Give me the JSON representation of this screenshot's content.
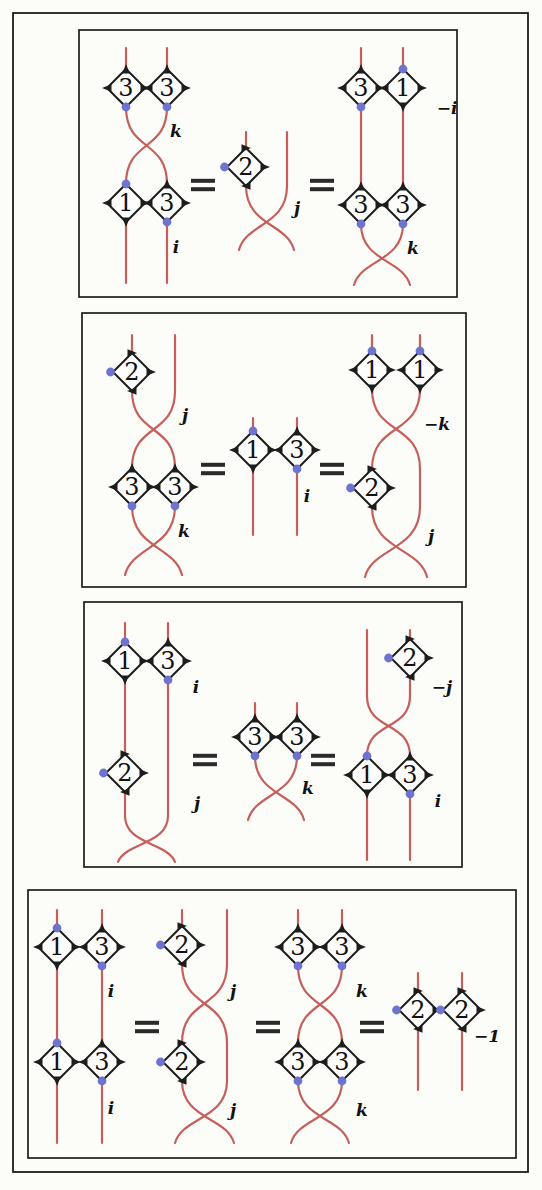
{
  "figure": {
    "canvas": {
      "width": 542,
      "height": 1190
    }
  },
  "colors": {
    "strand": "#c55f5b",
    "dot": "#6e74cd",
    "outline": "#1d1d1d",
    "number": "#111111",
    "label": "#111111",
    "equals": "#2a2a2a",
    "background": "#fcfcf9",
    "diamond_fill": "#fdfdfb",
    "border": "#1d1d1d"
  },
  "outer_frame": {
    "x": 13,
    "y": 13,
    "w": 515,
    "h": 1159
  },
  "panels": [
    {
      "id": "relation-1",
      "box": {
        "x": 79,
        "y": 30,
        "w": 378,
        "h": 267
      },
      "elements": [
        {
          "t": "line",
          "x": 126,
          "y1": 48,
          "y2": 69
        },
        {
          "t": "line",
          "x": 167,
          "y1": 48,
          "y2": 69
        },
        {
          "t": "diamond",
          "x": 126,
          "y": 88,
          "num": "3",
          "dot": "bottom"
        },
        {
          "t": "diamond",
          "x": 167,
          "y": 88,
          "num": "3",
          "dot": "bottom"
        },
        {
          "t": "cross",
          "x1": 126,
          "x2": 167,
          "y1": 107,
          "y2": 184,
          "flare": false
        },
        {
          "t": "text",
          "x": 176,
          "y": 131,
          "s": "k"
        },
        {
          "t": "diamond",
          "x": 126,
          "y": 203,
          "num": "1",
          "dot": "top"
        },
        {
          "t": "diamond",
          "x": 167,
          "y": 203,
          "num": "3",
          "dot": "bottom"
        },
        {
          "t": "line",
          "x": 126,
          "y1": 222,
          "y2": 283
        },
        {
          "t": "line",
          "x": 167,
          "y1": 222,
          "y2": 283
        },
        {
          "t": "text",
          "x": 176,
          "y": 247,
          "s": "i"
        },
        {
          "t": "equals",
          "x": 203,
          "y": 185
        },
        {
          "t": "line",
          "x": 246,
          "y1": 132,
          "y2": 148
        },
        {
          "t": "line",
          "x": 287,
          "y1": 132,
          "y2": 186
        },
        {
          "t": "diamond",
          "x": 246,
          "y": 167,
          "num": "2",
          "dot": "left"
        },
        {
          "t": "cross",
          "x1": 246,
          "x2": 287,
          "y1": 186,
          "y2": 250,
          "flare": true
        },
        {
          "t": "text",
          "x": 297,
          "y": 208,
          "s": "j"
        },
        {
          "t": "equals",
          "x": 322,
          "y": 185
        },
        {
          "t": "line",
          "x": 361,
          "y1": 48,
          "y2": 69
        },
        {
          "t": "line",
          "x": 403,
          "y1": 48,
          "y2": 69
        },
        {
          "t": "diamond",
          "x": 361,
          "y": 88,
          "num": "3",
          "dot": "bottom"
        },
        {
          "t": "diamond",
          "x": 403,
          "y": 88,
          "num": "1",
          "dot": "top"
        },
        {
          "t": "text",
          "x": 447,
          "y": 108,
          "s": "−i"
        },
        {
          "t": "line",
          "x": 361,
          "y1": 107,
          "y2": 186
        },
        {
          "t": "line",
          "x": 403,
          "y1": 107,
          "y2": 186
        },
        {
          "t": "diamond",
          "x": 361,
          "y": 205,
          "num": "3",
          "dot": "bottom"
        },
        {
          "t": "diamond",
          "x": 403,
          "y": 205,
          "num": "3",
          "dot": "bottom"
        },
        {
          "t": "cross",
          "x1": 361,
          "x2": 403,
          "y1": 224,
          "y2": 285,
          "flare": true
        },
        {
          "t": "text",
          "x": 413,
          "y": 248,
          "s": "k"
        }
      ]
    },
    {
      "id": "relation-2",
      "box": {
        "x": 82,
        "y": 313,
        "w": 384,
        "h": 274
      },
      "elements": [
        {
          "t": "line",
          "x": 132,
          "y1": 335,
          "y2": 353
        },
        {
          "t": "line",
          "x": 175,
          "y1": 335,
          "y2": 391
        },
        {
          "t": "diamond",
          "x": 132,
          "y": 372,
          "num": "2",
          "dot": "left"
        },
        {
          "t": "cross",
          "x1": 132,
          "x2": 175,
          "y1": 391,
          "y2": 468,
          "flare": false
        },
        {
          "t": "text",
          "x": 185,
          "y": 415,
          "s": "j"
        },
        {
          "t": "diamond",
          "x": 132,
          "y": 487,
          "num": "3",
          "dot": "bottom"
        },
        {
          "t": "diamond",
          "x": 175,
          "y": 487,
          "num": "3",
          "dot": "bottom"
        },
        {
          "t": "cross",
          "x1": 132,
          "x2": 175,
          "y1": 506,
          "y2": 575,
          "flare": true
        },
        {
          "t": "text",
          "x": 184,
          "y": 531,
          "s": "k"
        },
        {
          "t": "equals",
          "x": 213,
          "y": 469
        },
        {
          "t": "line",
          "x": 253,
          "y1": 418,
          "y2": 431
        },
        {
          "t": "line",
          "x": 297,
          "y1": 418,
          "y2": 431
        },
        {
          "t": "diamond",
          "x": 253,
          "y": 450,
          "num": "1",
          "dot": "top"
        },
        {
          "t": "diamond",
          "x": 297,
          "y": 450,
          "num": "3",
          "dot": "bottom"
        },
        {
          "t": "line",
          "x": 253,
          "y1": 469,
          "y2": 535
        },
        {
          "t": "line",
          "x": 297,
          "y1": 469,
          "y2": 535
        },
        {
          "t": "text",
          "x": 307,
          "y": 496,
          "s": "i"
        },
        {
          "t": "equals",
          "x": 332,
          "y": 469
        },
        {
          "t": "line",
          "x": 372,
          "y1": 335,
          "y2": 351
        },
        {
          "t": "line",
          "x": 420,
          "y1": 335,
          "y2": 351
        },
        {
          "t": "diamond",
          "x": 372,
          "y": 370,
          "num": "1",
          "dot": "top"
        },
        {
          "t": "diamond",
          "x": 420,
          "y": 370,
          "num": "1",
          "dot": "top"
        },
        {
          "t": "cross",
          "x1": 372,
          "x2": 420,
          "y1": 389,
          "y2": 469,
          "flare": false
        },
        {
          "t": "text",
          "x": 437,
          "y": 424,
          "s": "−k"
        },
        {
          "t": "diamond",
          "x": 372,
          "y": 488,
          "num": "2",
          "dot": "left"
        },
        {
          "t": "line",
          "x": 420,
          "y1": 469,
          "y2": 507
        },
        {
          "t": "cross",
          "x1": 372,
          "x2": 420,
          "y1": 507,
          "y2": 577,
          "flare": true
        },
        {
          "t": "text",
          "x": 431,
          "y": 536,
          "s": "j"
        }
      ]
    },
    {
      "id": "relation-3",
      "box": {
        "x": 84,
        "y": 602,
        "w": 378,
        "h": 265
      },
      "elements": [
        {
          "t": "line",
          "x": 125,
          "y1": 623,
          "y2": 642
        },
        {
          "t": "line",
          "x": 168,
          "y1": 623,
          "y2": 642
        },
        {
          "t": "diamond",
          "x": 125,
          "y": 661,
          "num": "1",
          "dot": "top"
        },
        {
          "t": "diamond",
          "x": 168,
          "y": 661,
          "num": "3",
          "dot": "bottom"
        },
        {
          "t": "text",
          "x": 196,
          "y": 687,
          "s": "i"
        },
        {
          "t": "line",
          "x": 125,
          "y1": 680,
          "y2": 754
        },
        {
          "t": "line",
          "x": 168,
          "y1": 680,
          "y2": 816
        },
        {
          "t": "diamond",
          "x": 125,
          "y": 773,
          "num": "2",
          "dot": "left"
        },
        {
          "t": "line",
          "x": 125,
          "y1": 792,
          "y2": 816
        },
        {
          "t": "cross",
          "x1": 125,
          "x2": 168,
          "y1": 816,
          "y2": 862,
          "flare": true
        },
        {
          "t": "text",
          "x": 197,
          "y": 803,
          "s": "j"
        },
        {
          "t": "equals",
          "x": 205,
          "y": 760
        },
        {
          "t": "line",
          "x": 255,
          "y1": 703,
          "y2": 718
        },
        {
          "t": "line",
          "x": 297,
          "y1": 703,
          "y2": 718
        },
        {
          "t": "diamond",
          "x": 255,
          "y": 737,
          "num": "3",
          "dot": "bottom"
        },
        {
          "t": "diamond",
          "x": 297,
          "y": 737,
          "num": "3",
          "dot": "bottom"
        },
        {
          "t": "cross",
          "x1": 255,
          "x2": 297,
          "y1": 756,
          "y2": 820,
          "flare": true
        },
        {
          "t": "text",
          "x": 308,
          "y": 788,
          "s": "k"
        },
        {
          "t": "equals",
          "x": 323,
          "y": 760
        },
        {
          "t": "line",
          "x": 367,
          "y1": 630,
          "y2": 696
        },
        {
          "t": "line",
          "x": 410,
          "y1": 630,
          "y2": 639
        },
        {
          "t": "diamond",
          "x": 410,
          "y": 658,
          "num": "2",
          "dot": "left"
        },
        {
          "t": "text",
          "x": 442,
          "y": 687,
          "s": "−j"
        },
        {
          "t": "line",
          "x": 410,
          "y1": 677,
          "y2": 696
        },
        {
          "t": "cross",
          "x1": 367,
          "x2": 410,
          "y1": 696,
          "y2": 756,
          "flare": false
        },
        {
          "t": "diamond",
          "x": 367,
          "y": 775,
          "num": "1",
          "dot": "top"
        },
        {
          "t": "diamond",
          "x": 410,
          "y": 775,
          "num": "3",
          "dot": "bottom"
        },
        {
          "t": "text",
          "x": 438,
          "y": 801,
          "s": "i"
        },
        {
          "t": "line",
          "x": 367,
          "y1": 794,
          "y2": 860
        },
        {
          "t": "line",
          "x": 410,
          "y1": 794,
          "y2": 860
        }
      ]
    },
    {
      "id": "relation-4",
      "box": {
        "x": 28,
        "y": 890,
        "w": 488,
        "h": 268
      },
      "elements": [
        {
          "t": "line",
          "x": 57,
          "y1": 910,
          "y2": 928
        },
        {
          "t": "line",
          "x": 102,
          "y1": 910,
          "y2": 928
        },
        {
          "t": "diamond",
          "x": 57,
          "y": 947,
          "num": "1",
          "dot": "top"
        },
        {
          "t": "diamond",
          "x": 102,
          "y": 947,
          "num": "3",
          "dot": "bottom"
        },
        {
          "t": "text",
          "x": 111,
          "y": 991,
          "s": "i"
        },
        {
          "t": "line",
          "x": 57,
          "y1": 966,
          "y2": 1043
        },
        {
          "t": "line",
          "x": 102,
          "y1": 966,
          "y2": 1043
        },
        {
          "t": "diamond",
          "x": 57,
          "y": 1062,
          "num": "1",
          "dot": "top"
        },
        {
          "t": "diamond",
          "x": 102,
          "y": 1062,
          "num": "3",
          "dot": "bottom"
        },
        {
          "t": "text",
          "x": 111,
          "y": 1108,
          "s": "i"
        },
        {
          "t": "line",
          "x": 57,
          "y1": 1081,
          "y2": 1143
        },
        {
          "t": "line",
          "x": 102,
          "y1": 1081,
          "y2": 1143
        },
        {
          "t": "equals",
          "x": 147,
          "y": 1027
        },
        {
          "t": "line",
          "x": 182,
          "y1": 910,
          "y2": 926
        },
        {
          "t": "line",
          "x": 227,
          "y1": 910,
          "y2": 964
        },
        {
          "t": "diamond",
          "x": 182,
          "y": 945,
          "num": "2",
          "dot": "left"
        },
        {
          "t": "cross",
          "x1": 182,
          "x2": 227,
          "y1": 964,
          "y2": 1043,
          "flare": false
        },
        {
          "t": "text",
          "x": 233,
          "y": 991,
          "s": "j"
        },
        {
          "t": "diamond",
          "x": 182,
          "y": 1062,
          "num": "2",
          "dot": "left"
        },
        {
          "t": "line",
          "x": 227,
          "y1": 1043,
          "y2": 1081
        },
        {
          "t": "cross",
          "x1": 182,
          "x2": 227,
          "y1": 1081,
          "y2": 1143,
          "flare": true
        },
        {
          "t": "text",
          "x": 233,
          "y": 1110,
          "s": "j"
        },
        {
          "t": "equals",
          "x": 268,
          "y": 1027
        },
        {
          "t": "line",
          "x": 298,
          "y1": 910,
          "y2": 928
        },
        {
          "t": "line",
          "x": 342,
          "y1": 910,
          "y2": 928
        },
        {
          "t": "diamond",
          "x": 298,
          "y": 947,
          "num": "3",
          "dot": "bottom"
        },
        {
          "t": "diamond",
          "x": 342,
          "y": 947,
          "num": "3",
          "dot": "bottom"
        },
        {
          "t": "cross",
          "x1": 298,
          "x2": 342,
          "y1": 966,
          "y2": 1043,
          "flare": false
        },
        {
          "t": "text",
          "x": 362,
          "y": 991,
          "s": "k"
        },
        {
          "t": "diamond",
          "x": 298,
          "y": 1062,
          "num": "3",
          "dot": "bottom"
        },
        {
          "t": "diamond",
          "x": 342,
          "y": 1062,
          "num": "3",
          "dot": "bottom"
        },
        {
          "t": "cross",
          "x1": 298,
          "x2": 342,
          "y1": 1081,
          "y2": 1143,
          "flare": true
        },
        {
          "t": "text",
          "x": 362,
          "y": 1110,
          "s": "k"
        },
        {
          "t": "equals",
          "x": 372,
          "y": 1027
        },
        {
          "t": "line",
          "x": 418,
          "y1": 973,
          "y2": 991
        },
        {
          "t": "line",
          "x": 462,
          "y1": 973,
          "y2": 991
        },
        {
          "t": "diamond",
          "x": 418,
          "y": 1010,
          "num": "2",
          "dot": "left"
        },
        {
          "t": "diamond",
          "x": 462,
          "y": 1010,
          "num": "2",
          "dot": "left"
        },
        {
          "t": "text",
          "x": 487,
          "y": 1036,
          "s": "−1"
        },
        {
          "t": "line",
          "x": 418,
          "y1": 1029,
          "y2": 1090
        },
        {
          "t": "line",
          "x": 462,
          "y1": 1029,
          "y2": 1090
        }
      ]
    }
  ]
}
